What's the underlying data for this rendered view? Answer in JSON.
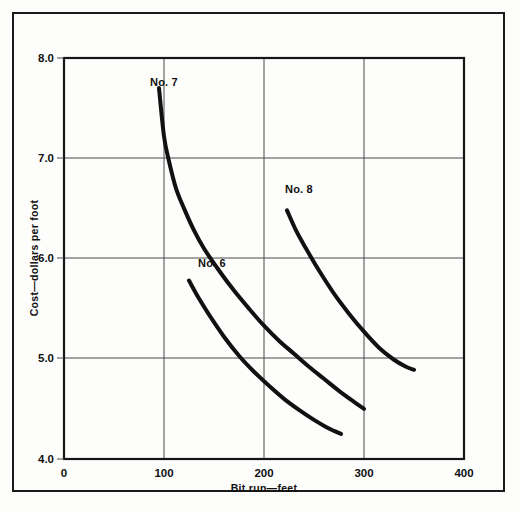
{
  "figure": {
    "background_color": "#fdfdfc",
    "frame_color": "#1a1a1a",
    "caption_partial": ""
  },
  "chart_data": {
    "type": "line",
    "title": "",
    "xlabel": "Bit run—feet",
    "ylabel": "Cost—dollars per foot",
    "xlim": [
      0,
      400
    ],
    "ylim": [
      4.0,
      8.0
    ],
    "xticks": [
      0,
      100,
      200,
      300,
      400
    ],
    "xticklabels": [
      "0",
      "100",
      "200",
      "300",
      "400"
    ],
    "yticks": [
      4.0,
      5.0,
      6.0,
      7.0,
      8.0
    ],
    "yticklabels": [
      "4.0",
      "5.0",
      "6.0",
      "7.0",
      "8.0"
    ],
    "grid": true,
    "legend_position": "inline-annotations",
    "line_color": "#111111",
    "series": [
      {
        "name": "No. 7",
        "label": "No. 7",
        "label_x": 100,
        "label_y": 7.72,
        "x": [
          95,
          100,
          105,
          112,
          120,
          130,
          140,
          155,
          170,
          185,
          200,
          215,
          230,
          245,
          260,
          275,
          290,
          300
        ],
        "y": [
          7.7,
          7.22,
          6.97,
          6.7,
          6.5,
          6.28,
          6.1,
          5.88,
          5.68,
          5.5,
          5.33,
          5.18,
          5.05,
          4.92,
          4.8,
          4.68,
          4.57,
          4.5
        ]
      },
      {
        "name": "No. 6",
        "label": "No. 6",
        "label_x": 148,
        "label_y": 5.92,
        "x": [
          125,
          135,
          145,
          160,
          175,
          190,
          205,
          220,
          235,
          250,
          262,
          270,
          277
        ],
        "y": [
          5.78,
          5.6,
          5.44,
          5.22,
          5.03,
          4.87,
          4.73,
          4.6,
          4.49,
          4.39,
          4.32,
          4.28,
          4.25
        ]
      },
      {
        "name": "No. 8",
        "label": "No. 8",
        "label_x": 235,
        "label_y": 6.65,
        "x": [
          223,
          232,
          242,
          255,
          270,
          285,
          300,
          315,
          330,
          342,
          350
        ],
        "y": [
          6.48,
          6.28,
          6.1,
          5.88,
          5.65,
          5.45,
          5.27,
          5.11,
          4.99,
          4.92,
          4.89
        ]
      }
    ]
  }
}
